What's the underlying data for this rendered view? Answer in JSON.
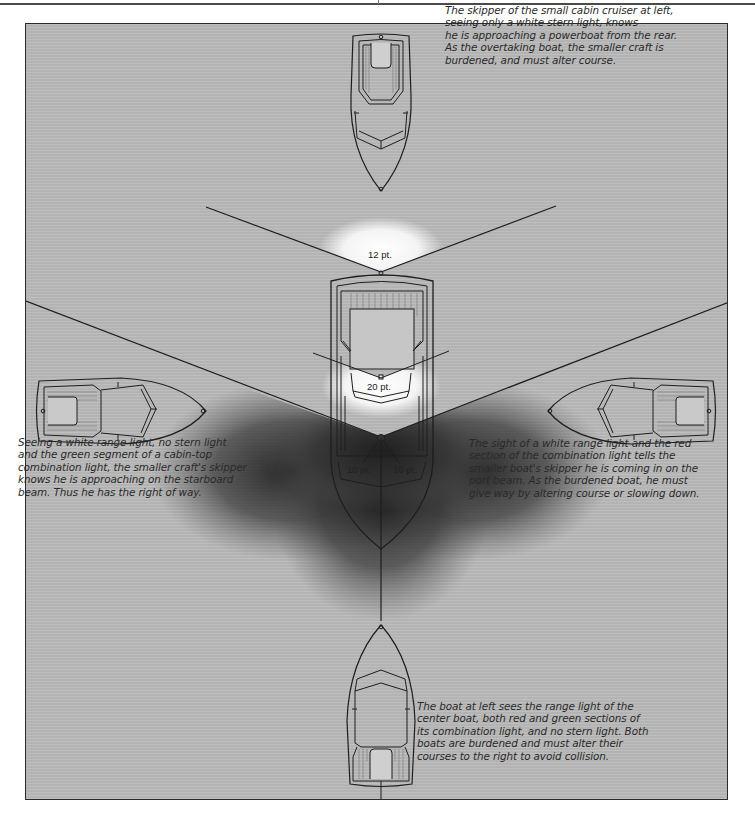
{
  "figure": {
    "background_color": "#b9b9b9",
    "shadow_color": "#2e2e2e",
    "glow_color": "#ffffff",
    "line_color": "#1e1e1e"
  },
  "lights": {
    "stern_light_label": "12 pt.",
    "range_light_label": "20 pt.",
    "port_combination_label": "10 pt.",
    "starboard_combination_label": "10 pt."
  },
  "captions": {
    "top": "The skipper of the small cabin cruiser at left,\nseeing only a white stern light, knows\nhe is approaching a powerboat from the rear.\nAs the overtaking boat, the smaller craft is\nburdened, and must alter course.",
    "left": "Seeing a white range light, no stern light\nand the green segment of a cabin-top\ncombination light, the smaller craft's skipper\nknows he is approaching on the starboard\nbeam. Thus he has the right of way.",
    "right": "The sight of a white range light and the red\nsection of the combination light tells the\nsmaller boat's skipper he is coming in on the\nport beam. As the burdened boat, he must\ngive way by altering course or slowing down.",
    "bottom": "The boat at left sees the range light of the\ncenter boat, both red and green sections of\nits combination light, and no stern light. Both\nboats are burdened and must alter their\ncourses to the right to avoid collision."
  },
  "boats": [
    {
      "name": "overtaking-boat",
      "position": "top",
      "heading": "down"
    },
    {
      "name": "center-powerboat",
      "position": "center",
      "heading": "down"
    },
    {
      "name": "starboard-beam-boat",
      "position": "left",
      "heading": "right"
    },
    {
      "name": "port-beam-boat",
      "position": "right",
      "heading": "left"
    },
    {
      "name": "head-on-boat",
      "position": "bottom",
      "heading": "up"
    }
  ]
}
